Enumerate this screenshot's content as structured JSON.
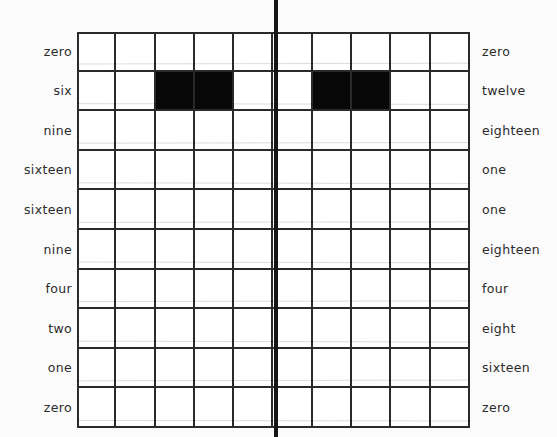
{
  "diagram": {
    "background_color": "#fbfbfb",
    "ink_color": "#2a2a2a",
    "fill_color": "#080808",
    "axis": {
      "name": "mirror-line",
      "orientation": "vertical",
      "color": "#151515",
      "x_px": 276,
      "spans_full_height": true
    },
    "grid": {
      "columns": 10,
      "rows": 10,
      "left_px": 77,
      "top_px": 32,
      "width_px": 393,
      "height_px": 396
    },
    "left_labels": [
      "zero",
      "six",
      "nine",
      "sixteen",
      "sixteen",
      "nine",
      "four",
      "two",
      "one",
      "zero"
    ],
    "right_labels": [
      "zero",
      "twelve",
      "eighteen",
      "one",
      "one",
      "eighteen",
      "four",
      "eight",
      "sixteen",
      "zero"
    ],
    "filled_cells": [
      {
        "row": 2,
        "columns": [
          3,
          4
        ]
      },
      {
        "row": 2,
        "columns": [
          7,
          8
        ]
      }
    ]
  },
  "chart_data": {
    "type": "heatmap",
    "xlabel": "",
    "ylabel": "",
    "columns": 10,
    "rows": 10,
    "grid": true,
    "legend_position": "none",
    "row_labels_left": [
      "zero",
      "six",
      "nine",
      "sixteen",
      "sixteen",
      "nine",
      "four",
      "two",
      "one",
      "zero"
    ],
    "row_labels_right": [
      "zero",
      "twelve",
      "eighteen",
      "one",
      "one",
      "eighteen",
      "four",
      "eight",
      "sixteen",
      "zero"
    ],
    "values": [
      [
        0,
        0,
        0,
        0,
        0,
        0,
        0,
        0,
        0,
        0
      ],
      [
        0,
        0,
        1,
        1,
        0,
        0,
        1,
        1,
        0,
        0
      ],
      [
        0,
        0,
        0,
        0,
        0,
        0,
        0,
        0,
        0,
        0
      ],
      [
        0,
        0,
        0,
        0,
        0,
        0,
        0,
        0,
        0,
        0
      ],
      [
        0,
        0,
        0,
        0,
        0,
        0,
        0,
        0,
        0,
        0
      ],
      [
        0,
        0,
        0,
        0,
        0,
        0,
        0,
        0,
        0,
        0
      ],
      [
        0,
        0,
        0,
        0,
        0,
        0,
        0,
        0,
        0,
        0
      ],
      [
        0,
        0,
        0,
        0,
        0,
        0,
        0,
        0,
        0,
        0
      ],
      [
        0,
        0,
        0,
        0,
        0,
        0,
        0,
        0,
        0,
        0
      ],
      [
        0,
        0,
        0,
        0,
        0,
        0,
        0,
        0,
        0,
        0
      ]
    ],
    "annotations": [
      {
        "text": "vertical mirror axis between columns 5 and 6"
      }
    ]
  }
}
